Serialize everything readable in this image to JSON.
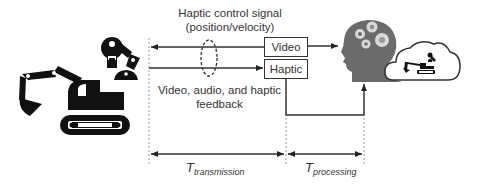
{
  "diagram": {
    "top_label": {
      "line1": "Haptic control signal",
      "line2": "(position/velocity)"
    },
    "bottom_label": {
      "line1": "Video, audio, and haptic",
      "line2": "feedback"
    },
    "boxes": {
      "video": "Video",
      "haptic": "Haptic"
    },
    "timing": {
      "transmission": {
        "symbol": "T",
        "subscript": "transmission"
      },
      "processing": {
        "symbol": "T",
        "subscript": "processing"
      }
    },
    "icons": [
      "excavator-icon",
      "robot-arm-icon",
      "human-head-gears-icon",
      "cloud-excavator-icon"
    ],
    "colors": {
      "line": "#333333",
      "icon_black": "#111111",
      "head_gray": "#6b6b6b",
      "dotted": "#999999"
    }
  }
}
